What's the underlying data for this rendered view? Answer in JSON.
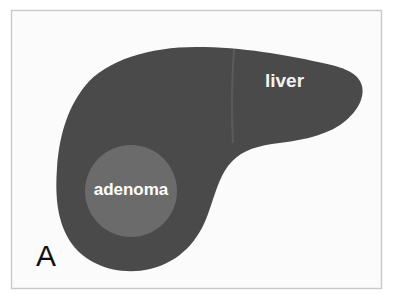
{
  "figure": {
    "panel_letter": "A",
    "type": "anatomical-schematic",
    "background_color": "#fbfbfb",
    "border_color": "#c9c9c9",
    "outer_margin_color": "#ffffff"
  },
  "structures": {
    "liver": {
      "label": "liver",
      "color": "#4a4a4a",
      "label_color": "#f2f2f2",
      "label_x": 265,
      "label_y": 82
    },
    "adenoma": {
      "label": "adenoma",
      "color": "#6b6b6b",
      "label_color": "#ffffff",
      "center_x": 131,
      "center_y": 191,
      "radius": 46
    },
    "fissure": {
      "name": "interlobar-fissure",
      "color": "#585858"
    }
  },
  "panel": {
    "letter": "A",
    "letter_color": "#111111",
    "x": 46,
    "y": 258
  }
}
